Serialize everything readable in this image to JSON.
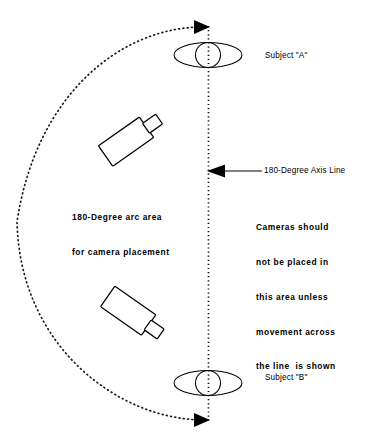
{
  "diagram": {
    "type": "180-degree-rule-camera-placement",
    "axis": {
      "label": "180-Degree Axis Line",
      "orientation": "vertical",
      "style": "dotted",
      "x": 208,
      "y_top": 27,
      "y_bottom": 420,
      "arrow_top": "right",
      "arrow_bottom": "right"
    },
    "arc": {
      "label_line1": "180-Degree arc area",
      "label_line2": "for camera placement",
      "style": "dotted",
      "degrees": 180,
      "side": "left",
      "leftmost_x": 16
    },
    "subjects": [
      {
        "name": "subject-a",
        "label": "Subject \"A\"",
        "cx": 208,
        "cy": 55
      },
      {
        "name": "subject-b",
        "label": "Subject \"B\"",
        "cx": 208,
        "cy": 383
      }
    ],
    "cameras": [
      {
        "name": "camera-upper",
        "cx": 131,
        "cy": 140,
        "rotation": -35
      },
      {
        "name": "camera-lower",
        "cx": 132,
        "cy": 314,
        "rotation": 35
      }
    ],
    "warning": {
      "line1": "Cameras should",
      "line2": "not be placed in",
      "line3": "this area unless",
      "line4": "movement across",
      "line5": "the line  is shown"
    },
    "colors": {
      "ink": "#000000",
      "background": "#ffffff"
    }
  }
}
